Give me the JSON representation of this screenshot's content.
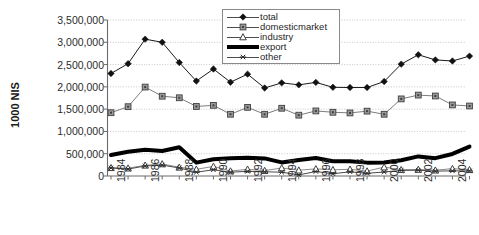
{
  "chart_data": {
    "type": "line",
    "title": "",
    "xlabel": "",
    "ylabel": "1000 NIS",
    "ylim": [
      0,
      3500000
    ],
    "ytick_labels": [
      "3,500,000",
      "3,000,000",
      "2,500,000",
      "2,000,000",
      "1,500,000",
      "1,000,000",
      "500,000",
      "0"
    ],
    "ytick_values": [
      3500000,
      3000000,
      2500000,
      2000000,
      1500000,
      1000000,
      500000,
      0
    ],
    "grid": true,
    "legend_position": "top-center",
    "x": [
      1984,
      1985,
      1986,
      1987,
      1988,
      1989,
      1990,
      1991,
      1992,
      1993,
      1994,
      1995,
      1996,
      1997,
      1998,
      1999,
      2000,
      2001,
      2002,
      2003,
      2004,
      2005
    ],
    "xtick_labels": [
      "1984",
      "1986",
      "1988",
      "1990",
      "1992",
      "1994",
      "1996",
      "1998",
      "2000",
      "2002",
      "2004"
    ],
    "xtick_values": [
      1984,
      1986,
      1988,
      1990,
      1992,
      1994,
      1996,
      1998,
      2000,
      2002,
      2004
    ],
    "series": [
      {
        "name": "total",
        "marker": "diamond",
        "color": "#1a1a1a",
        "line_width": 1,
        "values": [
          2300000,
          2520000,
          3070000,
          3000000,
          2545000,
          2130000,
          2400000,
          2105000,
          2285000,
          1975000,
          2090000,
          2045000,
          2100000,
          1990000,
          1985000,
          1985000,
          2120000,
          2510000,
          2720000,
          2605000,
          2580000,
          2690000
        ]
      },
      {
        "name": "domesticmarket",
        "marker": "square",
        "color": "#7d7d7d",
        "line_width": 1,
        "values": [
          1420000,
          1555000,
          1995000,
          1790000,
          1755000,
          1560000,
          1585000,
          1385000,
          1540000,
          1385000,
          1520000,
          1365000,
          1460000,
          1430000,
          1415000,
          1455000,
          1385000,
          1730000,
          1815000,
          1795000,
          1595000,
          1570000
        ]
      },
      {
        "name": "industry",
        "marker": "triangle",
        "color": "#8c8c8c",
        "line_width": 1,
        "values": [
          185000,
          175000,
          240000,
          270000,
          195000,
          150000,
          215000,
          110000,
          150000,
          120000,
          180000,
          130000,
          160000,
          140000,
          150000,
          110000,
          200000,
          140000,
          145000,
          130000,
          165000,
          140000
        ]
      },
      {
        "name": "export",
        "marker": "none",
        "color": "#000000",
        "line_width": 4,
        "values": [
          470000,
          545000,
          590000,
          560000,
          645000,
          300000,
          375000,
          400000,
          410000,
          395000,
          305000,
          360000,
          405000,
          330000,
          330000,
          300000,
          305000,
          355000,
          440000,
          400000,
          495000,
          660000
        ]
      },
      {
        "name": "other",
        "marker": "asterisk",
        "color": "#4a4a4a",
        "line_width": 1,
        "values": [
          180000,
          155000,
          225000,
          245000,
          180000,
          85000,
          140000,
          85000,
          105000,
          95000,
          85000,
          25000,
          100000,
          50000,
          95000,
          60000,
          90000,
          125000,
          130000,
          110000,
          115000,
          115000
        ]
      }
    ]
  },
  "legend": {
    "items": [
      {
        "label": "total",
        "key": "diamond"
      },
      {
        "label": "domesticmarket",
        "key": "square"
      },
      {
        "label": "industry",
        "key": "triangle"
      },
      {
        "label": "export",
        "key": "thickline"
      },
      {
        "label": "other",
        "key": "asterisk"
      }
    ]
  }
}
